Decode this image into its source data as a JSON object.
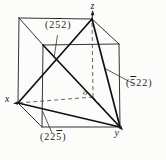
{
  "figure": {
    "ink_color": "#222222",
    "plane_labels": {
      "top": {
        "pre": "(2",
        "bar": "5",
        "post": "2)"
      },
      "right": {
        "pre": "(",
        "bar": "5",
        "post": "22)"
      },
      "bottom": {
        "pre": "(22",
        "bar": "5",
        "post": ")"
      }
    },
    "axis_labels": {
      "x": "x",
      "y": "y",
      "z": "z",
      "origin": "o"
    }
  }
}
